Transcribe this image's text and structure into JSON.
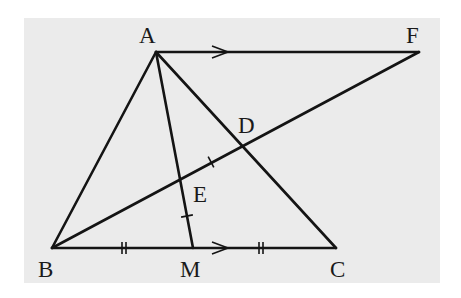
{
  "diagram": {
    "background": {
      "x": 24,
      "y": 18,
      "width": 416,
      "height": 265,
      "color": "#ebebeb"
    },
    "line_color": "#141414",
    "points": {
      "A": {
        "label": "A",
        "x": 156,
        "y": 52,
        "lx": 139,
        "ly": 43
      },
      "F": {
        "label": "F",
        "x": 419,
        "y": 52,
        "lx": 406,
        "ly": 43
      },
      "B": {
        "label": "B",
        "x": 52,
        "y": 248,
        "lx": 38,
        "ly": 277
      },
      "M": {
        "label": "M",
        "x": 193,
        "y": 248,
        "lx": 180,
        "ly": 277
      },
      "C": {
        "label": "C",
        "x": 336,
        "y": 248,
        "lx": 330,
        "ly": 277
      },
      "D": {
        "label": "D",
        "x": 243,
        "y": 145,
        "lx": 238,
        "ly": 133
      },
      "E": {
        "label": "E",
        "x": 181,
        "y": 180,
        "lx": 193,
        "ly": 202
      }
    },
    "segments": [
      {
        "name": "segment-af",
        "from": "A",
        "to": "F"
      },
      {
        "name": "segment-ab",
        "from": "A",
        "to": "B"
      },
      {
        "name": "segment-ac",
        "from": "A",
        "to": "C"
      },
      {
        "name": "segment-am",
        "from": "A",
        "to": "M"
      },
      {
        "name": "segment-bc",
        "from": "B",
        "to": "C"
      },
      {
        "name": "segment-bf",
        "from": "B",
        "to": "F"
      }
    ],
    "parallel_arrows": [
      {
        "on": "AF",
        "x": 220,
        "y": 52
      },
      {
        "on": "BC",
        "x": 220,
        "y": 248
      }
    ],
    "double_ticks": [
      {
        "on": "BM",
        "x": 124,
        "y": 248
      },
      {
        "on": "MC",
        "x": 261,
        "y": 248
      }
    ],
    "single_ticks": [
      {
        "on": "ED",
        "x": 211,
        "y": 162,
        "angle": -28
      },
      {
        "on": "EM",
        "x": 187,
        "y": 216,
        "angle": 79
      }
    ]
  }
}
